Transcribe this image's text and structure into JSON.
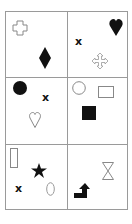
{
  "puzzle": {
    "rows": 3,
    "cols": 2,
    "cells": [
      {
        "id": "r1c1",
        "shapes": [
          "cross-outline",
          "diamond-filled"
        ]
      },
      {
        "id": "r1c2",
        "shapes": [
          "x-mark",
          "heart-filled",
          "move-arrows-outline"
        ]
      },
      {
        "id": "r2c1",
        "shapes": [
          "circle-filled",
          "x-mark",
          "heart-outline"
        ]
      },
      {
        "id": "r2c2",
        "shapes": [
          "circle-outline",
          "rectangle-outline",
          "square-filled"
        ]
      },
      {
        "id": "r3c1",
        "shapes": [
          "tall-rectangle-outline",
          "star-filled",
          "x-mark",
          "oval-outline"
        ]
      },
      {
        "id": "r3c2",
        "shapes": [
          "turn-arrow-filled",
          "hourglass-outline"
        ]
      }
    ],
    "x_label": "x",
    "colors": {
      "line": "#9a9a9a",
      "fill": "#111111",
      "outline": "#888888"
    }
  }
}
